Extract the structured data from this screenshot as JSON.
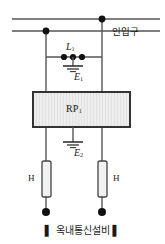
{
  "diagram": {
    "caption": {
      "left_bar": "▌",
      "text": "옥내통신설비",
      "right_bar": "▌"
    },
    "labels": {
      "inlet": "인입구",
      "arrester": "L",
      "arrester_sub": "1",
      "ground_upper": "E",
      "ground_upper_sub": "1",
      "protector_block": "RP",
      "protector_block_sub": "1",
      "ground_lower": "E",
      "ground_lower_sub": "2",
      "fuse_left": "H",
      "fuse_right": "H"
    },
    "colors": {
      "line": "#555555",
      "node": "#111111",
      "box_border": "#333333",
      "box_fill": "#ebebeb",
      "text": "#1a1a1a",
      "background": "#ffffff"
    },
    "geometry": {
      "width": 165,
      "height": 244,
      "left_rail_x": 46,
      "right_rail_x": 102,
      "top_line_y": 19,
      "second_line_y": 31,
      "arrester_row_y": 57,
      "box": {
        "x": 33,
        "y": 92,
        "w": 97,
        "h": 35
      },
      "fuse_left": {
        "x": 42,
        "y": 161,
        "w": 9,
        "h": 36
      },
      "fuse_right": {
        "x": 98,
        "y": 161,
        "w": 9,
        "h": 36
      },
      "terminal_y": 212
    }
  }
}
